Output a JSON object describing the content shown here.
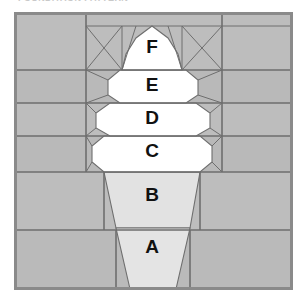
{
  "caption": {
    "text": "FOUNDATION PATTERN",
    "visible_note": "clipped text row at very top of image"
  },
  "diagram": {
    "type": "paper-piecing-block",
    "colors": {
      "background_patch": "#b9b9b9",
      "background_patch_light": "#c2c2c2",
      "scoop_fill": "#ffffff",
      "cone_fill": "#e2e2e2",
      "seam_line": "#6e6e6e",
      "outer_border": "#8a8a8a",
      "label_text": "#111111",
      "page": "#ffffff"
    },
    "frame": {
      "x": 15,
      "y": 13,
      "width": 277,
      "height": 276
    },
    "segments": [
      {
        "id": "A",
        "label": "A",
        "role": "cone-lower",
        "fill": "cone",
        "cx": 152,
        "cy": 248
      },
      {
        "id": "B",
        "label": "B",
        "role": "cone-upper",
        "fill": "cone",
        "cx": 152,
        "cy": 196
      },
      {
        "id": "C",
        "label": "C",
        "role": "scoop-1",
        "fill": "scoop",
        "cx": 152,
        "cy": 152
      },
      {
        "id": "D",
        "label": "D",
        "role": "scoop-2",
        "fill": "scoop",
        "cx": 152,
        "cy": 119
      },
      {
        "id": "E",
        "label": "E",
        "role": "scoop-3",
        "fill": "scoop",
        "cx": 152,
        "cy": 86
      },
      {
        "id": "F",
        "label": "F",
        "role": "scoop-top",
        "fill": "scoop",
        "cx": 152,
        "cy": 48
      }
    ],
    "row_dividers_y": [
      13,
      70,
      103,
      136,
      172,
      230,
      289
    ],
    "column_dividers_x": [
      15,
      86,
      222,
      292
    ],
    "label_font_size": 19
  }
}
